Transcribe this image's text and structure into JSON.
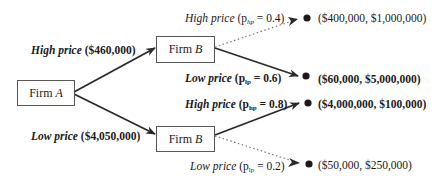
{
  "diagram": {
    "type": "game-tree",
    "nodes": {
      "root": {
        "label": "Firm",
        "player": "A"
      },
      "top": {
        "label": "Firm",
        "player": "B"
      },
      "bottom": {
        "label": "Firm",
        "player": "B"
      }
    },
    "first_moves": [
      {
        "name": "High price",
        "value": "($460,000)",
        "to": "top"
      },
      {
        "name": "Low price",
        "value": "($4,050,000)",
        "to": "bottom"
      }
    ],
    "second_moves": [
      {
        "name": "High price",
        "prob_prefix": "(p",
        "prob_sub": "hp",
        "prob_value": " = 0.4)",
        "payoff": "($400,000, $1,000,000)",
        "style": "dotted",
        "from": "top"
      },
      {
        "name": "Low price",
        "prob_prefix": "(p",
        "prob_sub": "lp",
        "prob_value": " = 0.6)",
        "payoff": "($60,000, $5,000,000)",
        "style": "solid",
        "from": "top"
      },
      {
        "name": "High price",
        "prob_prefix": "(p",
        "prob_sub": "hp",
        "prob_value": " = 0.8)",
        "payoff": "($4,000,000, $100,000)",
        "style": "solid",
        "from": "bottom"
      },
      {
        "name": "Low price",
        "prob_prefix": "(p",
        "prob_sub": "lp",
        "prob_value": " = 0.2)",
        "payoff": "($50,000, $250,000)",
        "style": "dotted",
        "from": "bottom"
      }
    ],
    "colors": {
      "line": "#2a2a2a",
      "dotted": "#777777",
      "box_border": "#555555"
    }
  }
}
